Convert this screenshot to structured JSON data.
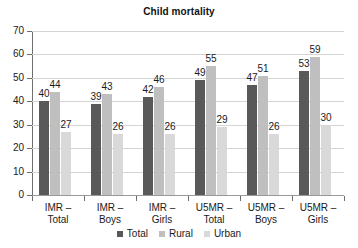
{
  "chart_data": {
    "type": "bar",
    "title": "Child mortality",
    "xlabel": "",
    "ylabel": "",
    "ylim": [
      0,
      70
    ],
    "yticks": [
      0,
      10,
      20,
      30,
      40,
      50,
      60,
      70
    ],
    "grid": true,
    "legend_position": "bottom",
    "categories": [
      "IMR – Total",
      "IMR – Boys",
      "IMR – Girls",
      "U5MR – Total",
      "U5MR – Boys",
      "U5MR – Girls"
    ],
    "category_lines": [
      [
        "IMR –",
        "Total"
      ],
      [
        "IMR –",
        "Boys"
      ],
      [
        "IMR –",
        "Girls"
      ],
      [
        "U5MR –",
        "Total"
      ],
      [
        "U5MR –",
        "Boys"
      ],
      [
        "U5MR –",
        "Girls"
      ]
    ],
    "series": [
      {
        "name": "Total",
        "color": "#595959",
        "values": [
          40,
          39,
          42,
          49,
          47,
          53
        ]
      },
      {
        "name": "Rural",
        "color": "#bfbfbf",
        "values": [
          44,
          43,
          46,
          55,
          51,
          59
        ]
      },
      {
        "name": "Urban",
        "color": "#d9d9d9",
        "values": [
          27,
          26,
          26,
          29,
          26,
          30
        ]
      }
    ]
  },
  "legend": {
    "items": [
      {
        "label": "Total"
      },
      {
        "label": "Rural"
      },
      {
        "label": "Urban"
      }
    ]
  },
  "axis": {
    "y_tick_labels": [
      "70",
      "60",
      "50",
      "40",
      "30",
      "20",
      "10",
      "0"
    ]
  },
  "colors": {
    "total": "#595959",
    "rural": "#bfbfbf",
    "urban": "#d9d9d9",
    "gridline": "#d4d4d4",
    "axis": "#6e6e6e",
    "text": "#1a1a1a",
    "background": "#ffffff"
  }
}
